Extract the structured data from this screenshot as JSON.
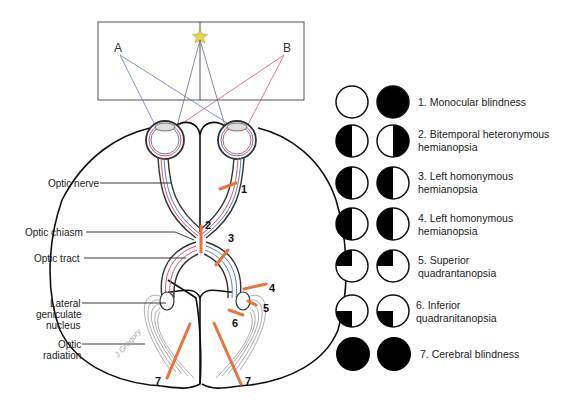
{
  "figure": {
    "visual_field": {
      "point_a": "A",
      "point_b": "B",
      "fixation_icon": "star-icon",
      "colors": {
        "frame": "#555555",
        "star": "#e8d24a",
        "left_ray": "#5b7fb8",
        "right_ray": "#d9547a",
        "center_ray": "#555555"
      }
    },
    "anatomy_labels": {
      "optic_nerve": "Optic nerve",
      "optic_chiasm": "Optic chiasm",
      "optic_tract": "Optic tract",
      "lgn_line1": "Lateral",
      "lgn_line2": "geniculate",
      "lgn_line3": "nucleus",
      "radiation_line1": "Optic",
      "radiation_line2": "radiation"
    },
    "lesion_numbers": {
      "n1": "1",
      "n2": "2",
      "n3": "3",
      "n4": "4",
      "n5": "5",
      "n6": "6",
      "n7a": "7",
      "n7b": "7"
    },
    "lesion_color": "#e8743b",
    "pathway_colors": {
      "temporal": "#d9547a",
      "nasal": "#5b7fb8"
    },
    "signature": "J Gregory"
  },
  "legend": {
    "items": [
      {
        "id": 1,
        "line1": "1. Monocular blindness",
        "line2": "",
        "left_eye": "clear",
        "right_eye": "full"
      },
      {
        "id": 2,
        "line1": "2. Bitemporal heteronymous",
        "line2": "hemianopsia",
        "left_eye": "left-half",
        "right_eye": "right-half"
      },
      {
        "id": 3,
        "line1": "3. Left homonymous",
        "line2": "hemianopsia",
        "left_eye": "left-half",
        "right_eye": "left-half"
      },
      {
        "id": 4,
        "line1": "4. Left homonymous",
        "line2": "hemianopsia",
        "left_eye": "left-half",
        "right_eye": "left-half"
      },
      {
        "id": 5,
        "line1": "5. Superior",
        "line2": "quadrantanopsia",
        "left_eye": "upper-left-quadrant",
        "right_eye": "upper-left-quadrant"
      },
      {
        "id": 6,
        "line1": "6. Inferior",
        "line2": "quadranitanopsia",
        "left_eye": "lower-left-quadrant",
        "right_eye": "lower-left-quadrant"
      },
      {
        "id": 7,
        "line1": "7. Cerebral blindness",
        "line2": "",
        "left_eye": "full",
        "right_eye": "full"
      }
    ]
  }
}
